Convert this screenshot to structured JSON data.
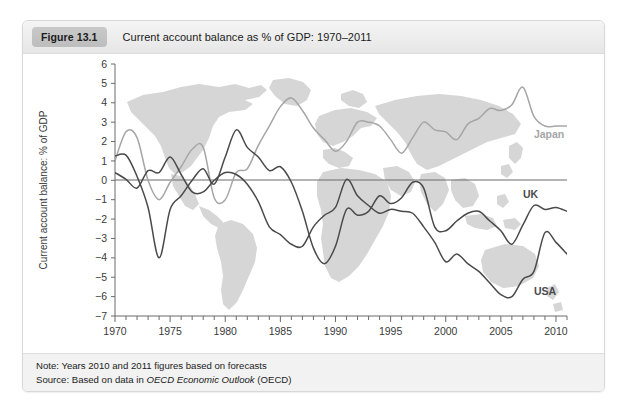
{
  "figure": {
    "badge": "Figure 13.1",
    "title": "Current account balance as % of GDP: 1970–2011"
  },
  "footer": {
    "note_label": "Note:",
    "note_text": " Years 2010 and 2011 figures based on forecasts",
    "source_label": "Source:",
    "source_prefix": " Based on data in ",
    "source_italic": "OECD Economic Outlook",
    "source_suffix": " (OECD)"
  },
  "colors": {
    "japan": "#a6a6a6",
    "uk": "#4a4a4a",
    "usa": "#4a4a4a",
    "axis": "#6b6b6b",
    "zero_line": "#6b6b6b",
    "map_fill": "#d2d2d2",
    "badge": "#c3c3c3",
    "header_bg": "#ededed",
    "footer_bg": "#f2f2f2",
    "card_border": "#d8d8d8"
  },
  "chart_data": {
    "type": "line",
    "title": "Current account balance as % of GDP: 1970–2011",
    "xlabel": "",
    "ylabel": "Current account balance: % of GDP",
    "xlim": [
      1970,
      2011
    ],
    "ylim": [
      -7,
      6
    ],
    "grid": false,
    "legend": "inline-labels",
    "background_image": "world-map-silhouette",
    "xticks": [
      1970,
      1975,
      1980,
      1985,
      1990,
      1995,
      2000,
      2005,
      2010
    ],
    "xtick_minor_step": 1,
    "yticks": [
      6,
      5,
      4,
      3,
      2,
      1,
      0,
      -1,
      -2,
      -3,
      -4,
      -5,
      -6,
      -7
    ],
    "x": [
      1970,
      1971,
      1972,
      1973,
      1974,
      1975,
      1976,
      1977,
      1978,
      1979,
      1980,
      1981,
      1982,
      1983,
      1984,
      1985,
      1986,
      1987,
      1988,
      1989,
      1990,
      1991,
      1992,
      1993,
      1994,
      1995,
      1996,
      1997,
      1998,
      1999,
      2000,
      2001,
      2002,
      2003,
      2004,
      2005,
      2006,
      2007,
      2008,
      2009,
      2010,
      2011
    ],
    "series": [
      {
        "name": "Japan",
        "color": "#a6a6a6",
        "label_x": 2008,
        "label_y": 2.2,
        "values": [
          1.0,
          2.5,
          2.2,
          0.0,
          -1.0,
          -0.1,
          0.7,
          1.6,
          1.7,
          -0.9,
          -1.0,
          0.4,
          0.6,
          1.8,
          2.8,
          3.8,
          4.25,
          3.6,
          2.7,
          2.1,
          1.5,
          2.0,
          3.0,
          3.0,
          2.8,
          2.1,
          1.4,
          2.2,
          3.0,
          2.6,
          2.5,
          2.1,
          2.9,
          3.2,
          3.7,
          3.6,
          3.9,
          4.8,
          3.3,
          2.8,
          2.8,
          2.8
        ]
      },
      {
        "name": "UK",
        "color": "#4a4a4a",
        "label_x": 2007,
        "label_y": -0.9,
        "values": [
          1.25,
          1.3,
          0.2,
          -1.4,
          -4.0,
          -1.5,
          -0.8,
          0.0,
          0.6,
          -0.2,
          1.2,
          2.6,
          1.7,
          1.2,
          0.5,
          0.7,
          -0.1,
          -1.6,
          -3.5,
          -4.3,
          -3.4,
          -1.5,
          -1.8,
          -1.6,
          -0.8,
          -1.2,
          -0.9,
          -0.1,
          -0.4,
          -2.4,
          -2.6,
          -2.1,
          -1.7,
          -1.6,
          -2.1,
          -2.6,
          -3.3,
          -2.3,
          -1.3,
          -1.5,
          -1.4,
          -1.6
        ]
      },
      {
        "name": "USA",
        "color": "#4a4a4a",
        "label_x": 2008,
        "label_y": -5.9,
        "values": [
          0.4,
          0.05,
          -0.4,
          0.5,
          0.4,
          1.2,
          0.3,
          -0.6,
          -0.6,
          0.0,
          0.4,
          0.3,
          -0.2,
          -1.1,
          -2.4,
          -2.8,
          -3.3,
          -3.4,
          -2.4,
          -1.8,
          -1.4,
          0.05,
          -0.8,
          -1.3,
          -1.7,
          -1.5,
          -1.6,
          -1.7,
          -2.4,
          -3.2,
          -4.2,
          -3.8,
          -4.3,
          -4.7,
          -5.3,
          -5.9,
          -6.0,
          -5.1,
          -4.7,
          -2.7,
          -3.2,
          -3.8
        ]
      }
    ]
  }
}
